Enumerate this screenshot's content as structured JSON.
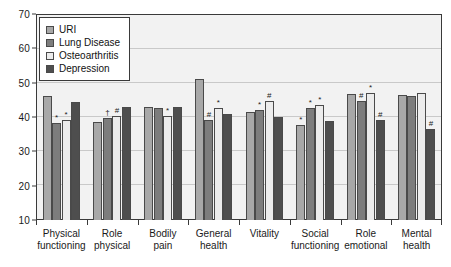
{
  "chart_data": {
    "type": "bar",
    "title": "",
    "xlabel": "",
    "ylabel": "",
    "ylim": [
      10,
      70
    ],
    "yticks": [
      10,
      20,
      30,
      40,
      50,
      60,
      70
    ],
    "ytick_labels": [
      "10",
      "20",
      "30",
      "40",
      "50",
      "60",
      "70"
    ],
    "grid": true,
    "legend_position": "upper-left inside",
    "categories": [
      "Physical functioning",
      "Role physical",
      "Bodily pain",
      "General health",
      "Vitality",
      "Social functioning",
      "Role emotional",
      "Mental health"
    ],
    "category_lines": [
      [
        "Physical",
        "functioning"
      ],
      [
        "Role",
        "physical"
      ],
      [
        "Bodily",
        "pain"
      ],
      [
        "General",
        "health"
      ],
      [
        "Vitality",
        ""
      ],
      [
        "Social",
        "functioning"
      ],
      [
        "Role",
        "emotional"
      ],
      [
        "Mental",
        "health"
      ]
    ],
    "series": [
      {
        "name": "URI",
        "color": "#a8a8a8",
        "values": [
          46.0,
          38.6,
          42.8,
          51.0,
          41.4,
          37.8,
          46.6,
          46.4
        ],
        "markers": [
          "",
          "",
          "",
          "",
          "",
          "*",
          "",
          ""
        ]
      },
      {
        "name": "Lung Disease",
        "color": "#7d7d7d",
        "values": [
          38.4,
          39.6,
          42.5,
          39.2,
          42.0,
          42.6,
          44.6,
          46.0
        ],
        "markers": [
          "*",
          "†",
          "",
          "#",
          "*",
          "*",
          "#",
          ""
        ]
      },
      {
        "name": "Osteoarthritis",
        "color": "#ececec",
        "values": [
          39.2,
          40.4,
          40.4,
          42.5,
          44.8,
          43.6,
          47.0,
          47.0
        ],
        "markers": [
          "*",
          "#",
          "*",
          "*",
          "#",
          "*",
          "*",
          ""
        ]
      },
      {
        "name": "Depression",
        "color": "#4e4e4e",
        "values": [
          44.4,
          43.0,
          43.0,
          41.0,
          40.0,
          38.8,
          39.0,
          36.4
        ],
        "markers": [
          "",
          "",
          "",
          "",
          "",
          "",
          "#",
          "#"
        ]
      }
    ],
    "legend_entries": [
      "URI",
      "Lung Disease",
      "Osteoarthritis",
      "Depression"
    ],
    "significance_symbols": [
      "*",
      "†",
      "#"
    ],
    "colors": {
      "plot_background": "#f2f2f2",
      "page_background": "#ffffff",
      "axis": "#3a3a3a",
      "gridline": "#c9c9c9",
      "text": "#1a1a1a"
    }
  }
}
